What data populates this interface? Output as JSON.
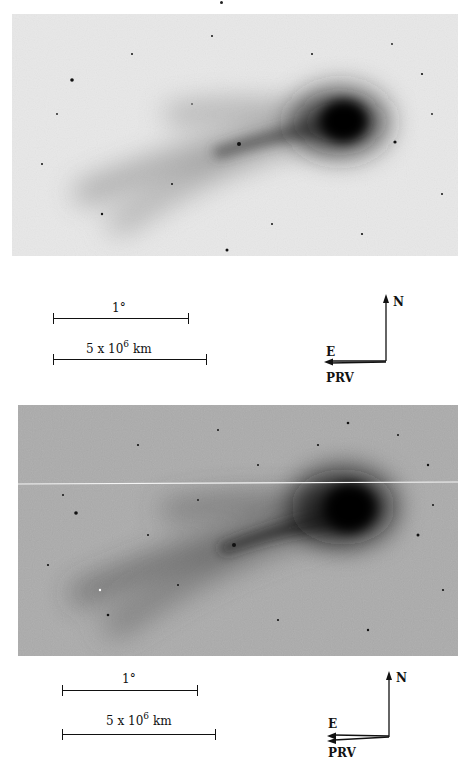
{
  "figure": {
    "panels": [
      {
        "id": "top",
        "background": "#e6e6e6",
        "scale_bars": [
          {
            "label": "1°",
            "length_px": 134
          },
          {
            "label_base": "5 x 10",
            "label_exp": "6",
            "label_unit": "km",
            "length_px": 152
          }
        ],
        "orientation": {
          "north_label": "N",
          "east_label": "E",
          "prv_label": "PRV"
        }
      },
      {
        "id": "bottom",
        "background": "#a9a9a9",
        "scale_bars": [
          {
            "label": "1°",
            "length_px": 134
          },
          {
            "label_base": "5 x 10",
            "label_exp": "6",
            "label_unit": "km",
            "length_px": 152
          }
        ],
        "orientation": {
          "north_label": "N",
          "east_label": "E",
          "prv_label": "PRV"
        }
      }
    ]
  }
}
